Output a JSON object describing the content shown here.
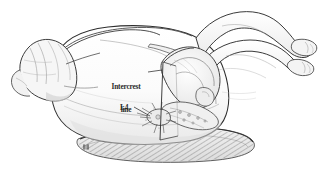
{
  "figure": {
    "background_color": "#ffffff",
    "ink_color": "#2b2b2b",
    "shade_color": "#d8d8d8",
    "width": 321,
    "height": 173
  },
  "labels": {
    "intercrest_line_1": "Intercrest",
    "intercrest_line_2": "line",
    "l4": "L4"
  },
  "annotations": {
    "signature": "artist-signature-mark"
  },
  "anatomy": {
    "parts": [
      "head",
      "hair",
      "shoulder",
      "back",
      "torso",
      "buttock",
      "upper-leg",
      "lower-leg",
      "upper-foot",
      "lower-foot",
      "iliac-crest",
      "ilium",
      "sacrum",
      "lumbar-vertebrae",
      "spinous-processes",
      "support-table"
    ]
  }
}
